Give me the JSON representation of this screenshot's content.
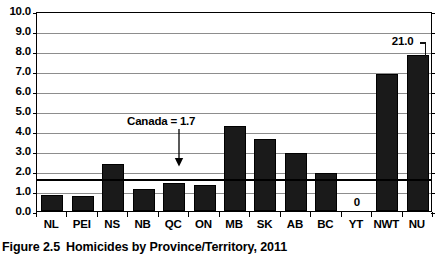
{
  "caption": {
    "figure_number": "Figure 2.5",
    "title": "Homicides by Province/Territory, 2011"
  },
  "annotation": {
    "canada_label": "Canada = 1.7",
    "canada_value": 1.7,
    "nu_value_label": "21.0",
    "yt_zero_label": "0"
  },
  "axis": {
    "y_ticks": [
      "10.0",
      "9.0",
      "8.0",
      "7.0",
      "6.0",
      "5.0",
      "4.0",
      "3.0",
      "2.0",
      "1.0",
      "0.0"
    ],
    "x_labels": [
      "NL",
      "PEI",
      "NS",
      "NB",
      "QC",
      "ON",
      "MB",
      "SK",
      "AB",
      "BC",
      "YT",
      "NWT",
      "NU"
    ]
  },
  "colors": {
    "bar_fill": "#1a1a1a",
    "gridline": "#8d8d8d",
    "axis": "#000000",
    "background": "#ffffff"
  },
  "chart_data": {
    "type": "bar",
    "title": "Homicides by Province/Territory, 2011",
    "xlabel": "",
    "ylabel": "",
    "ylim": [
      0.0,
      10.0
    ],
    "ytick_step": 1.0,
    "grid": true,
    "legend": "none",
    "categories": [
      "NL",
      "PEI",
      "NS",
      "NB",
      "QC",
      "ON",
      "MB",
      "SK",
      "AB",
      "BC",
      "YT",
      "NWT",
      "NU"
    ],
    "values": [
      0.8,
      0.76,
      2.35,
      1.1,
      1.38,
      1.28,
      4.27,
      3.6,
      2.9,
      1.9,
      0,
      6.85,
      21.0
    ],
    "display_values": [
      0.8,
      0.76,
      2.35,
      1.1,
      1.38,
      1.28,
      4.27,
      3.6,
      2.9,
      1.9,
      0,
      6.85,
      7.78
    ],
    "truncated_bars": [
      {
        "category": "NU",
        "actual_value": 21.0,
        "label": "21.0",
        "note": "bar axis-broken; drawn to ~7.8 with break mark"
      }
    ],
    "data_labels": [
      {
        "category": "YT",
        "label": "0"
      },
      {
        "category": "NU",
        "label": "21.0"
      }
    ],
    "reference_lines": [
      {
        "label": "Canada = 1.7",
        "value": 1.7,
        "style": "thick-solid-black"
      }
    ]
  }
}
